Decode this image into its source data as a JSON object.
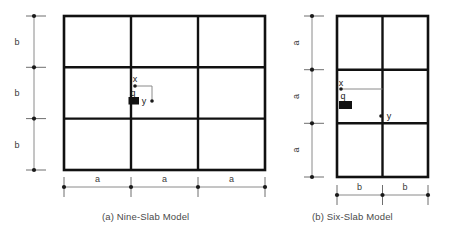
{
  "figure": {
    "background_color": "#ffffff",
    "line_color": "#111111",
    "dimension_color": "#8a8a8a"
  },
  "panels": [
    {
      "id": "a",
      "caption": "(a) Nine-Slab Model",
      "grid": {
        "columns": 3,
        "rows": 3
      },
      "horizontal_dimension": {
        "labels": [
          "a",
          "a",
          "a"
        ],
        "position": "bottom",
        "segments": 3
      },
      "vertical_dimension": {
        "labels": [
          "b",
          "b",
          "b"
        ],
        "position": "left",
        "segments": 3
      },
      "annotations": {
        "load_label": "q",
        "x_axis_label": "x",
        "y_axis_label": "y"
      }
    },
    {
      "id": "b",
      "caption": "(b) Six-Slab Model",
      "grid": {
        "columns": 2,
        "rows": 3
      },
      "horizontal_dimension": {
        "labels": [
          "b",
          "b"
        ],
        "position": "bottom",
        "segments": 2
      },
      "vertical_dimension": {
        "labels": [
          "a",
          "a",
          "a"
        ],
        "position": "left",
        "segments": 3
      },
      "annotations": {
        "load_label": "q",
        "x_axis_label": "x",
        "y_axis_label": "y"
      }
    }
  ]
}
